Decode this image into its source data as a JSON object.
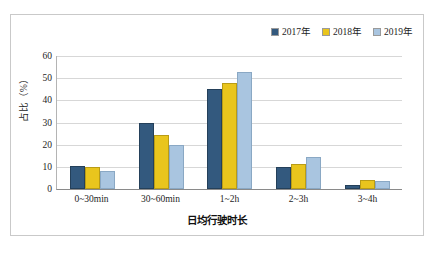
{
  "chart_data": {
    "type": "bar",
    "title": "",
    "xlabel": "日均行驶时长",
    "ylabel": "占比（%）",
    "categories": [
      "0~30min",
      "30~60min",
      "1~2h",
      "2~3h",
      "3~4h"
    ],
    "series": [
      {
        "name": "2017年",
        "color": "#33597e",
        "values": [
          10.5,
          30,
          45,
          10,
          2
        ]
      },
      {
        "name": "2018年",
        "color": "#e9c51d",
        "values": [
          10,
          24.5,
          48,
          11.5,
          4
        ]
      },
      {
        "name": "2019年",
        "color": "#a9c5e0",
        "values": [
          8,
          20,
          53,
          14.5,
          3.5
        ]
      }
    ],
    "ylim": [
      0,
      60
    ],
    "yticks": [
      0,
      10,
      20,
      30,
      40,
      50,
      60
    ],
    "ytick_labels": [
      "0",
      "10",
      "20",
      "30",
      "40",
      "50",
      "60"
    ],
    "grid": true,
    "legend_position": "top-right"
  }
}
